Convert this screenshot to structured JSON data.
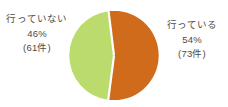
{
  "chart_data": {
    "type": "pie",
    "title": "",
    "subtitle": "",
    "xlabel": "",
    "ylabel": "",
    "legend_position": "labels-outside",
    "grid": false,
    "total_count": 134,
    "start_angle_deg": -7,
    "direction": "clockwise",
    "categories": [
      "行っている",
      "行っていない"
    ],
    "values": [
      54,
      46
    ],
    "counts": [
      73,
      61
    ],
    "colors": [
      "#cf6b1b",
      "#bbdb6c"
    ],
    "slices": [
      {
        "name": "行っている",
        "percent": 54,
        "percent_label": "54%",
        "count": 73,
        "count_label": "(73件)",
        "color": "#cf6b1b"
      },
      {
        "name": "行っていない",
        "percent": 46,
        "percent_label": "46%",
        "count": 61,
        "count_label": "(61件)",
        "color": "#bbdb6c"
      }
    ]
  },
  "labels": {
    "left": {
      "name": "行っていない",
      "percent": "46%",
      "count": "(61件)"
    },
    "right": {
      "name": "行っている",
      "percent": "54%",
      "count": "(73件)"
    }
  },
  "colors": {
    "background": "#ffffff",
    "text": "#4d4a46",
    "slice_orange": "#cf6b1b",
    "slice_green": "#bbdb6c",
    "divider": "#ffffff"
  }
}
